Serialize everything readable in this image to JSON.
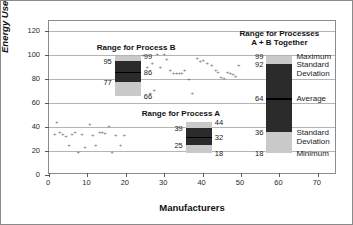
{
  "chart_data": {
    "type": "scatter",
    "title": "",
    "xlabel": "Manufacturers",
    "ylabel": "Energy Use (MJ)",
    "ylabel_main": "Energy Use",
    "ylabel_unit": "(MJ)",
    "xlim": [
      0,
      75
    ],
    "ylim": [
      0,
      128
    ],
    "grid": "horizontal",
    "legend": "none",
    "yticks": [
      0,
      20,
      40,
      60,
      80,
      100,
      120
    ],
    "xticks": [
      0,
      10,
      20,
      30,
      40,
      50,
      60,
      70
    ],
    "series": [
      {
        "name": "Process A",
        "points": [
          [
            1.5,
            33.5
          ],
          [
            2.0,
            44.0
          ],
          [
            2.8,
            35.5
          ],
          [
            3.6,
            34.0
          ],
          [
            4.4,
            32.0
          ],
          [
            5.2,
            24.5
          ],
          [
            6.0,
            33.5
          ],
          [
            6.8,
            35.0
          ],
          [
            7.6,
            19.0
          ],
          [
            8.6,
            34.0
          ],
          [
            9.4,
            22.5
          ],
          [
            10.6,
            42.0
          ],
          [
            11.4,
            33.0
          ],
          [
            12.2,
            24.5
          ],
          [
            13.2,
            35.0
          ],
          [
            13.9,
            35.5
          ],
          [
            14.6,
            34.5
          ],
          [
            15.6,
            40.5
          ],
          [
            16.4,
            18.5
          ],
          [
            17.4,
            32.5
          ],
          [
            18.6,
            24.5
          ],
          [
            19.6,
            33.0
          ]
        ]
      },
      {
        "name": "Process B",
        "points": [
          [
            22.0,
            84.0
          ],
          [
            22.6,
            78.0
          ],
          [
            23.2,
            91.0
          ],
          [
            24.5,
            99.5
          ],
          [
            25.6,
            89.5
          ],
          [
            26.4,
            67.5
          ],
          [
            26.9,
            93.0
          ],
          [
            27.4,
            70.0
          ],
          [
            28.2,
            100.0
          ],
          [
            29.0,
            89.0
          ],
          [
            30.0,
            100.0
          ],
          [
            30.7,
            96.0
          ],
          [
            31.6,
            86.5
          ],
          [
            32.4,
            84.5
          ],
          [
            33.2,
            84.0
          ],
          [
            33.9,
            84.5
          ],
          [
            34.6,
            84.0
          ],
          [
            35.3,
            87.0
          ],
          [
            36.4,
            79.0
          ],
          [
            37.3,
            68.0
          ],
          [
            38.6,
            97.0
          ],
          [
            39.4,
            94.0
          ],
          [
            40.2,
            95.5
          ],
          [
            41.2,
            92.5
          ],
          [
            42.4,
            91.0
          ],
          [
            43.4,
            87.0
          ],
          [
            44.0,
            85.0
          ],
          [
            44.8,
            81.0
          ],
          [
            45.6,
            80.5
          ],
          [
            46.5,
            85.0
          ],
          [
            47.2,
            84.0
          ],
          [
            47.9,
            83.5
          ],
          [
            48.6,
            81.5
          ],
          [
            49.4,
            91.0
          ]
        ]
      }
    ],
    "range_boxes": [
      {
        "id": "process-b",
        "caption": "Range for Process B",
        "x_center": 20.5,
        "minimum": 66,
        "std_low": 77,
        "average": 86,
        "std_high": 95,
        "maximum": 99,
        "labels": {
          "maximum": "99",
          "std_high": "95",
          "average": "86",
          "std_low": "77",
          "minimum": "66"
        }
      },
      {
        "id": "process-a",
        "caption": "Range for Process A",
        "x_center": 39.0,
        "minimum": 18,
        "std_low": 25,
        "average": 32,
        "std_high": 39,
        "maximum": 44,
        "labels": {
          "maximum": "44",
          "std_high": "39",
          "average": "32",
          "std_low": "25",
          "minimum": "18"
        }
      },
      {
        "id": "combined",
        "caption_line1": "Range for Processes",
        "caption_line2": "A + B Together",
        "x_center": 60.0,
        "minimum": 18,
        "std_low": 36,
        "average": 64,
        "std_high": 92,
        "maximum": 99,
        "labels": {
          "maximum": "99",
          "std_high": "92",
          "average": "64",
          "std_low": "36",
          "minimum": "18"
        },
        "annotations": {
          "maximum": "Maximum",
          "std_dev_upper": "Standard\nDeviation",
          "std_dev_upper_l1": "Standard",
          "std_dev_upper_l2": "Deviation",
          "average": "Average",
          "std_dev_lower_l1": "Standard",
          "std_dev_lower_l2": "Deviation",
          "minimum": "Minimum"
        }
      }
    ],
    "colors": {
      "light_band": "#c9c9c9",
      "dark_band": "#2b2b2b",
      "average_line": "#000000",
      "gridline": "#b4b4b4",
      "point": "#6d6d6d",
      "frame": "#8c8c8c"
    }
  }
}
